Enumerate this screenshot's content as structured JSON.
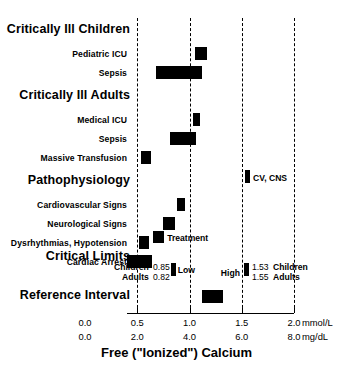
{
  "chart_data": {
    "type": "bar",
    "title": "",
    "xlabel": "Free (\"Ionized\") Calcium",
    "ylabel": "",
    "xlim": [
      0.0,
      2.0
    ],
    "grid": true,
    "legend": "none",
    "orientation": "horizontal",
    "axes": [
      {
        "unit": "mmol/L",
        "ticks": [
          "0.0",
          "0.5",
          "1.0",
          "1.5",
          "2.0"
        ],
        "values": [
          0.0,
          0.5,
          1.0,
          1.5,
          2.0
        ]
      },
      {
        "unit": "mg/dL",
        "ticks": [
          "0.0",
          "2.0",
          "4.0",
          "6.0",
          "8.0"
        ],
        "values": [
          0.0,
          2.0,
          4.0,
          6.0,
          8.0
        ]
      }
    ],
    "gridlines_mmol": [
      0.5,
      1.0,
      1.5,
      2.0
    ],
    "groups": [
      {
        "label": "Critically Ill Children",
        "items": [
          {
            "label": "Pediatric ICU",
            "low": 1.05,
            "high": 1.17
          },
          {
            "label": "Sepsis",
            "low": 0.68,
            "high": 1.12
          }
        ]
      },
      {
        "label": "Critically Ill Adults",
        "items": [
          {
            "label": "Medical ICU",
            "low": 1.03,
            "high": 1.1
          },
          {
            "label": "Sepsis",
            "low": 0.81,
            "high": 1.06
          },
          {
            "label": "Massive Transfusion",
            "low": 0.54,
            "high": 0.63
          }
        ]
      },
      {
        "label": "Pathophysiology",
        "items": [
          {
            "label": "Cardiovascular Signs",
            "low": 0.88,
            "high": 0.96
          },
          {
            "label": "Neurological Signs",
            "low": 0.75,
            "high": 0.86
          },
          {
            "label": "Dysrhythmias, Hypotension",
            "low": 0.52,
            "high": 0.61
          },
          {
            "label": "Cardiac Arrest",
            "low": 0.4,
            "high": 0.64
          }
        ]
      }
    ],
    "markers": [
      {
        "label": "CV, CNS",
        "value": 1.56,
        "label_side": "right"
      },
      {
        "label": "Treatment",
        "value": 0.7,
        "label_side": "right"
      }
    ],
    "critical_limits": {
      "label": "Critical Limits",
      "low_label": "Low",
      "high_label": "High",
      "low_value": 0.84,
      "high_value": 1.54,
      "left_rows": [
        {
          "name": "Children",
          "value": "0.85"
        },
        {
          "name": "Adults",
          "value": "0.82"
        }
      ],
      "right_rows": [
        {
          "value": "1.53",
          "name": "Children"
        },
        {
          "value": "1.55",
          "name": "Adults"
        }
      ]
    },
    "reference_interval": {
      "label": "Reference Interval",
      "low": 1.12,
      "high": 1.32
    }
  }
}
